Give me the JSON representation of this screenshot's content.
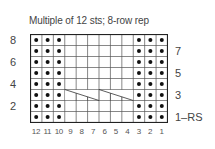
{
  "title": "Multiple of 12 sts; 8-row rep",
  "grid": {
    "cols": 12,
    "rows": 8,
    "purl_columns": [
      12,
      11,
      10,
      3,
      2,
      1
    ],
    "cable_row": 3,
    "cable_span": [
      9,
      4
    ]
  },
  "left_row_labels": [
    {
      "row": 8,
      "text": "8"
    },
    {
      "row": 6,
      "text": "6"
    },
    {
      "row": 4,
      "text": "4"
    },
    {
      "row": 2,
      "text": "2"
    }
  ],
  "right_row_labels": [
    {
      "row": 7,
      "text": "7"
    },
    {
      "row": 5,
      "text": "5"
    },
    {
      "row": 3,
      "text": "3"
    },
    {
      "row": 1,
      "text": "1–RS"
    }
  ],
  "column_labels": [
    "12",
    "11",
    "10",
    "9",
    "8",
    "7",
    "6",
    "5",
    "4",
    "3",
    "2",
    "1"
  ],
  "colors": {
    "grid_line": "#555555",
    "outer_border": "#222222",
    "dot": "#111111",
    "text": "#444444"
  }
}
